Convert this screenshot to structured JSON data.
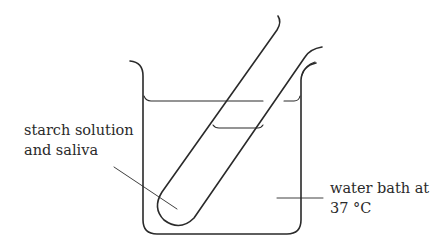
{
  "diagram": {
    "type": "lab-apparatus",
    "labels": {
      "tube_contents": {
        "line1": "starch solution",
        "line2": "and saliva"
      },
      "bath": {
        "line1": "water bath at",
        "line2": "37 °C"
      }
    },
    "components": [
      "beaker",
      "water-bath-surface",
      "test-tube",
      "tube-liquid-surface",
      "label-leader-lines"
    ],
    "colors": {
      "stroke": "#2a2a2a",
      "background": "#ffffff"
    }
  }
}
